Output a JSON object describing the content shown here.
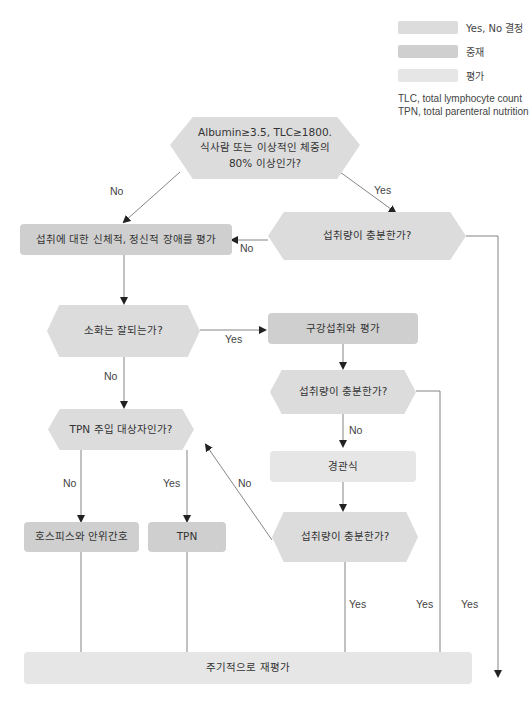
{
  "legend": {
    "items": [
      {
        "label": "Yes, No 결정",
        "color": "#dcdcdc"
      },
      {
        "label": "중재",
        "color": "#cfcfcf"
      },
      {
        "label": "평가",
        "color": "#e6e6e6"
      }
    ],
    "notes": [
      "TLC, total lymphocyte count",
      "TPN, total parenteral nutrition"
    ]
  },
  "nodes": {
    "start": {
      "lines": [
        "Albumin≥3.5, TLC≥1800.",
        "식사람 또는 이상적인 체중의",
        "80% 이상인가?"
      ]
    },
    "assess_barriers": "섭취에 대한 신체적, 정신적 장애를 평가",
    "intake_adequate_1": "섭취량이 충분한가?",
    "digestion_ok": "소화는 잘되는가?",
    "oral_intake_eval": "구강섭취와 평가",
    "intake_adequate_2": "섭취량이 충분한가?",
    "tube_feeding": "경관식",
    "tpn_candidate": "TPN 주입 대상자인가?",
    "intake_adequate_3": "섭취량이 충분한가?",
    "hospice": "호스피스와 안위간호",
    "tpn": "TPN",
    "reevaluate": "주기적으로 재평가"
  },
  "edge_labels": {
    "start_no": "No",
    "start_yes": "Yes",
    "intake1_no": "No",
    "digestion_yes": "Yes",
    "digestion_no": "No",
    "intake2_no": "No",
    "tpn_no": "No",
    "tpn_yes": "Yes",
    "intake3_no": "No",
    "intake3_yes": "Yes",
    "intake2_yes": "Yes",
    "intake1_yes": "Yes"
  },
  "colors": {
    "decision": "#dcdcdc",
    "mediate": "#cfcfcf",
    "evaluate": "#e6e6e6",
    "line": "#555555"
  }
}
